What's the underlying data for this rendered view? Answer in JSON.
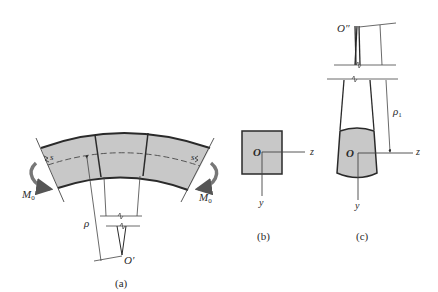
{
  "figure": {
    "panels": [
      {
        "id": "a",
        "caption": "(a)",
        "labels": {
          "moment_left": "M",
          "moment_left_sub": "0",
          "moment_right": "M",
          "moment_right_sub": "0",
          "section_left": "s",
          "section_right": "s",
          "radius": "ρ",
          "center": "O′"
        },
        "description": "Curved beam segment in pure bending with neutral surface (dashed) and radius of curvature ρ to center O′"
      },
      {
        "id": "b",
        "caption": "(b)",
        "labels": {
          "origin": "O",
          "z_axis": "z",
          "y_axis": "y"
        },
        "description": "Square cross section before deformation"
      },
      {
        "id": "c",
        "caption": "(c)",
        "labels": {
          "origin": "O",
          "z_axis": "z",
          "y_axis": "y",
          "center": "O″",
          "radius": "ρ",
          "radius_sub": "1"
        },
        "description": "Deformed cross section showing anticlastic curvature with radius ρ1 to center O″"
      }
    ],
    "colors": {
      "fill": "#c8c8c8",
      "stroke": "#2a2a2a",
      "thin_line": "#444444",
      "arrow": "#555555"
    }
  }
}
